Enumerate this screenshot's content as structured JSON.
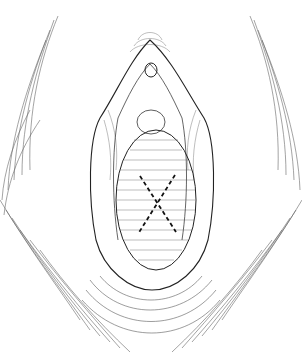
{
  "illustration": {
    "kind": "anatomical line drawing",
    "background_color": "#ffffff",
    "line_color": "#222222",
    "marking": {
      "type": "dashed-x",
      "color": "#111111",
      "center": [
        160,
        199
      ],
      "arm_a": [
        [
          140,
          176
        ],
        [
          176,
          232
        ]
      ],
      "arm_b": [
        [
          175,
          175
        ],
        [
          138,
          234
        ]
      ]
    }
  }
}
